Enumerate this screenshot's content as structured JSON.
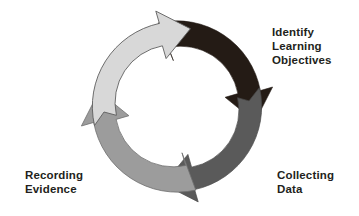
{
  "diagram": {
    "type": "cyclical-process",
    "direction": "clockwise",
    "background_color": "#ffffff",
    "center": {
      "x": 177,
      "y": 107
    },
    "outer_radius": 85,
    "inner_radius": 58,
    "label_color": "#231f20",
    "outline_color": "#3a3a3a",
    "stages": [
      {
        "id": "identify-learning-objectives",
        "label": "Identify\nLearning\nObjectives",
        "label_lines": [
          "Identify",
          "Learning",
          "Objectives"
        ],
        "arrow_color": "#241b15",
        "color_name": "near-black",
        "position": "top",
        "order": 1,
        "start_angle": -103,
        "end_angle": -12
      },
      {
        "id": "collecting-data",
        "label": "Collecting\nData",
        "label_lines": [
          "Collecting",
          "Data"
        ],
        "arrow_color": "#5a5a5a",
        "color_name": "dark-gray",
        "position": "right",
        "order": 2,
        "start_angle": -13,
        "end_angle": 78
      },
      {
        "id": "recording-evidence",
        "label": "Recording\nEvidence",
        "label_lines": [
          "Recording",
          "Evidence"
        ],
        "arrow_color": "#9c9c9c",
        "color_name": "mid-gray",
        "position": "bottom",
        "order": 3,
        "start_angle": 77,
        "end_angle": 168
      },
      {
        "id": "unlabeled-left-stage",
        "label": "",
        "label_lines": [],
        "arrow_color": "#d8d8d8",
        "color_name": "light-gray",
        "position": "left",
        "order": 4,
        "start_angle": 167,
        "end_angle": 258
      }
    ]
  },
  "labels": {
    "identify": "Identify\nLearning\nObjectives",
    "collecting": "Collecting\nData",
    "recording": "Recording\nEvidence"
  }
}
